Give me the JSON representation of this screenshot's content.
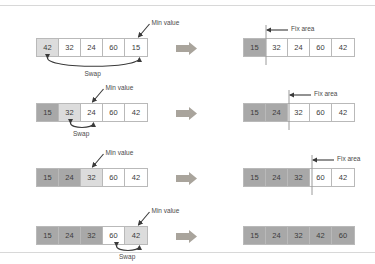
{
  "figure": {
    "colors": {
      "cell_border": "#b9b9b9",
      "shade_light": "#dcdcdc",
      "shade_dark": "#a8a8a8",
      "arrow_fill": "#a9a49c",
      "text": "#4a4a4a",
      "divider": "#9a9a9a",
      "rule": "#d8d8d8"
    },
    "labels": {
      "min_value": "Min value",
      "swap": "Swap",
      "fix_area": "Fix area"
    },
    "rows": [
      {
        "before": {
          "values": [
            "42",
            "32",
            "24",
            "60",
            "15"
          ],
          "shades": [
            "light",
            "none",
            "none",
            "none",
            "none"
          ]
        },
        "after": {
          "values": [
            "15",
            "32",
            "24",
            "60",
            "42"
          ],
          "shades": [
            "dark",
            "none",
            "none",
            "none",
            "none"
          ],
          "fix_index": 1
        },
        "min_index": 4,
        "swap_from": 0,
        "swap_to": 4
      },
      {
        "before": {
          "values": [
            "15",
            "32",
            "24",
            "60",
            "42"
          ],
          "shades": [
            "dark",
            "light",
            "none",
            "none",
            "none"
          ]
        },
        "after": {
          "values": [
            "15",
            "24",
            "32",
            "60",
            "42"
          ],
          "shades": [
            "dark",
            "dark",
            "none",
            "none",
            "none"
          ],
          "fix_index": 2
        },
        "min_index": 2,
        "swap_from": 1,
        "swap_to": 2
      },
      {
        "before": {
          "values": [
            "15",
            "24",
            "32",
            "60",
            "42"
          ],
          "shades": [
            "dark",
            "dark",
            "light",
            "none",
            "none"
          ]
        },
        "after": {
          "values": [
            "15",
            "24",
            "32",
            "60",
            "42"
          ],
          "shades": [
            "dark",
            "dark",
            "dark",
            "none",
            "none"
          ],
          "fix_index": 3
        },
        "min_index": 2,
        "swap_from": null,
        "swap_to": null
      },
      {
        "before": {
          "values": [
            "15",
            "24",
            "32",
            "60",
            "42"
          ],
          "shades": [
            "dark",
            "dark",
            "dark",
            "none",
            "light"
          ]
        },
        "after": {
          "values": [
            "15",
            "24",
            "32",
            "42",
            "60"
          ],
          "shades": [
            "dark",
            "dark",
            "dark",
            "dark",
            "dark"
          ],
          "fix_index": null
        },
        "min_index": 4,
        "swap_from": 3,
        "swap_to": 4
      }
    ]
  }
}
